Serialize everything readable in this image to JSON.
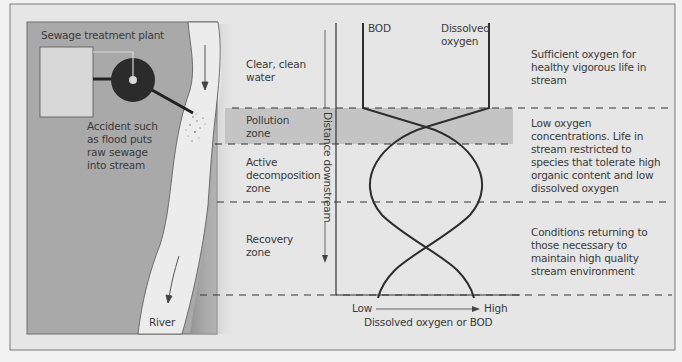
{
  "diagram": {
    "left_panel": {
      "plant_label": "Sewage treatment plant",
      "accident_label": "Accident such\nas flood puts\nraw sewage\ninto stream",
      "river_label": "River"
    },
    "zones": [
      {
        "name": "Clear, clean\nwater",
        "description": "Sufficient oxygen for\nhealthy vigorous life in\nstream"
      },
      {
        "name": "Pollution\nzone",
        "description": "Low oxygen\nconcentrations. Life in\nstream restricted to\nspecies that tolerate high\norganic content and low\ndissolved oxygen"
      },
      {
        "name": "Active\ndecomposition\nzone",
        "description": ""
      },
      {
        "name": "Recovery\nzone",
        "description": "Conditions returning to\nthose necessary to\nmaintain high quality\nstream environment"
      }
    ],
    "curves": {
      "bod_label": "BOD",
      "do_label": "Dissolved\noxygen"
    },
    "axes": {
      "y_label": "Distance downstream",
      "x_low": "Low",
      "x_high": "High",
      "x_label": "Dissolved oxygen or BOD"
    },
    "colors": {
      "frame_bg": "#e6e6e6",
      "land": "#a9a9a9",
      "river": "#ececec",
      "pollution_band": "#c4c4c4",
      "ink": "#333333"
    }
  }
}
